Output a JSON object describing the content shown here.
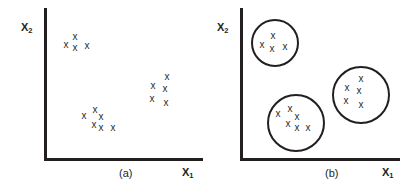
{
  "figure": {
    "width": 412,
    "height": 194,
    "background": "#ffffff",
    "ink_color": "#231f20",
    "mark_glyph": "x"
  },
  "panels": [
    {
      "id": "a",
      "caption": "(a)",
      "caption_x": 119,
      "caption_y": 168,
      "x_axis_label": "X",
      "x_axis_label_sub": "1",
      "y_axis_label": "X",
      "y_axis_label_sub": "2",
      "origin_x": 44,
      "origin_y": 158,
      "axis_top_y": 8,
      "axis_right_x": 203,
      "y_label_x": 21,
      "y_label_y": 22,
      "x_label_x": 182,
      "x_label_y": 167,
      "rings": [],
      "clusters": [
        {
          "name": "cluster-top-left",
          "points": [
            {
              "x": 66,
              "y": 45
            },
            {
              "x": 75,
              "y": 37
            },
            {
              "x": 75,
              "y": 48
            },
            {
              "x": 87,
              "y": 46
            }
          ]
        },
        {
          "name": "cluster-bottom-middle",
          "points": [
            {
              "x": 84,
              "y": 116
            },
            {
              "x": 95,
              "y": 110
            },
            {
              "x": 101,
              "y": 117
            },
            {
              "x": 94,
              "y": 125
            },
            {
              "x": 101,
              "y": 128
            },
            {
              "x": 113,
              "y": 128
            }
          ]
        },
        {
          "name": "cluster-right",
          "points": [
            {
              "x": 153,
              "y": 86
            },
            {
              "x": 167,
              "y": 77
            },
            {
              "x": 165,
              "y": 89
            },
            {
              "x": 152,
              "y": 99
            },
            {
              "x": 166,
              "y": 103
            }
          ]
        }
      ]
    },
    {
      "id": "b",
      "caption": "(b)",
      "caption_x": 325,
      "caption_y": 168,
      "x_axis_label": "X",
      "x_axis_label_sub": "1",
      "y_axis_label": "X",
      "y_axis_label_sub": "2",
      "origin_x": 240,
      "origin_y": 158,
      "axis_top_y": 8,
      "axis_right_x": 400,
      "y_label_x": 217,
      "y_label_y": 22,
      "x_label_x": 382,
      "x_label_y": 167,
      "rings": [
        {
          "name": "ring-top-left",
          "cx": 275,
          "cy": 43,
          "r": 24
        },
        {
          "name": "ring-bottom-left",
          "cx": 296,
          "cy": 123,
          "r": 29
        },
        {
          "name": "ring-right",
          "cx": 361,
          "cy": 95,
          "r": 29
        }
      ],
      "clusters": [
        {
          "name": "cluster-top-left",
          "points": [
            {
              "x": 262,
              "y": 45
            },
            {
              "x": 273,
              "y": 36
            },
            {
              "x": 272,
              "y": 49
            },
            {
              "x": 285,
              "y": 47
            }
          ]
        },
        {
          "name": "cluster-bottom-left",
          "points": [
            {
              "x": 278,
              "y": 114
            },
            {
              "x": 290,
              "y": 109
            },
            {
              "x": 297,
              "y": 117
            },
            {
              "x": 288,
              "y": 124
            },
            {
              "x": 297,
              "y": 128
            },
            {
              "x": 308,
              "y": 128
            }
          ]
        },
        {
          "name": "cluster-right",
          "points": [
            {
              "x": 347,
              "y": 88
            },
            {
              "x": 361,
              "y": 79
            },
            {
              "x": 359,
              "y": 91
            },
            {
              "x": 346,
              "y": 101
            },
            {
              "x": 361,
              "y": 105
            }
          ]
        }
      ]
    }
  ]
}
